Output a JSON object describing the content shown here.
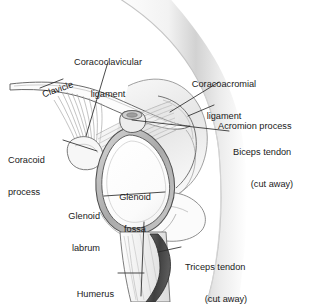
{
  "diagram": {
    "type": "anatomical-illustration",
    "background_color": "#ffffff",
    "line_color": "#3a3a3a",
    "label_color": "#1a1a1a",
    "shade_light": "#e8e8e8",
    "shade_mid": "#b9b9b9",
    "shade_dark": "#6e6e6e",
    "tendon_dark": "#4a4a4a"
  },
  "labels": [
    {
      "id": "coracoclavicular",
      "line1": "Coracoclavicular",
      "line2": "ligament",
      "align": "center"
    },
    {
      "id": "clavicle",
      "line1": "Clavicle",
      "line2": "",
      "align": "left",
      "rotation_deg": -19
    },
    {
      "id": "coracoacromial",
      "line1": "Coracoacromial",
      "line2": "ligament",
      "align": "center"
    },
    {
      "id": "acromion",
      "line1": "Acromion process",
      "line2": "",
      "align": "left"
    },
    {
      "id": "biceps",
      "line1": "Biceps tendon",
      "line2": "(cut away)",
      "align": "left"
    },
    {
      "id": "coracoid",
      "line1": "Coracoid",
      "line2": "process",
      "align": "left"
    },
    {
      "id": "glenoid-fossa",
      "line1": "Glenoid",
      "line2": "fossa",
      "align": "center"
    },
    {
      "id": "glenoid-labrum",
      "line1": "Glenoid",
      "line2": "labrum",
      "align": "right"
    },
    {
      "id": "triceps",
      "line1": "Triceps tendon",
      "line2": "(cut away)",
      "align": "left"
    },
    {
      "id": "humerus",
      "line1": "Humerus",
      "line2": "",
      "align": "right"
    }
  ]
}
